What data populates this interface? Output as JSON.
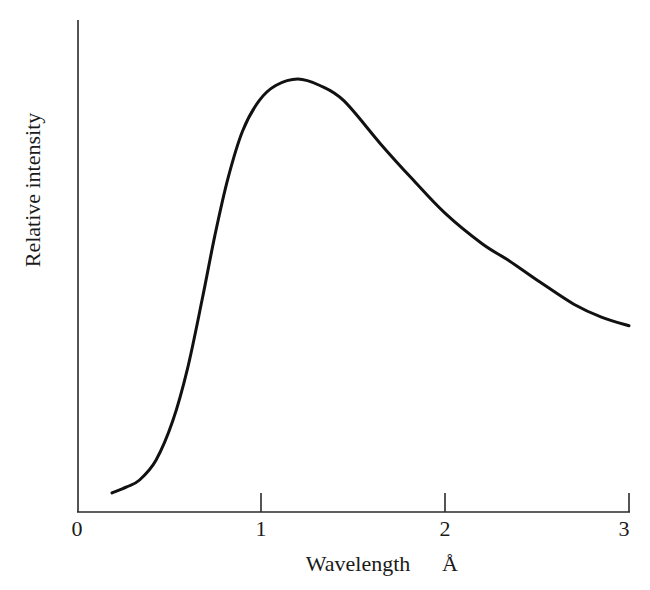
{
  "chart_data": {
    "type": "line",
    "title": "",
    "xlabel": "Wavelength",
    "xlabel_unit": "Å",
    "ylabel": "Relative intensity",
    "xlim": [
      0,
      3
    ],
    "ylim": [
      0,
      1.1
    ],
    "x_ticks": [
      0,
      1,
      2,
      3
    ],
    "x_tick_labels": [
      "0",
      "1",
      "2",
      "3"
    ],
    "y_ticks": [],
    "grid": false,
    "legend": null,
    "series": [
      {
        "name": "Relative intensity",
        "color": "#111111",
        "x": [
          0.19,
          0.27,
          0.34,
          0.43,
          0.52,
          0.6,
          0.68,
          0.75,
          0.82,
          0.9,
          0.99,
          1.08,
          1.2,
          1.32,
          1.45,
          1.65,
          1.82,
          2.0,
          2.2,
          2.35,
          2.52,
          2.7,
          2.85,
          3.0
        ],
        "values": [
          0.044,
          0.058,
          0.074,
          0.12,
          0.21,
          0.33,
          0.49,
          0.64,
          0.77,
          0.88,
          0.95,
          0.985,
          1.0,
          0.985,
          0.95,
          0.85,
          0.77,
          0.69,
          0.62,
          0.58,
          0.53,
          0.48,
          0.45,
          0.43
        ]
      }
    ]
  },
  "labels": {
    "ylabel": "Relative intensity",
    "xlabel": "Wavelength",
    "xunit": "Å",
    "ticks": [
      "0",
      "1",
      "2",
      "3"
    ]
  }
}
